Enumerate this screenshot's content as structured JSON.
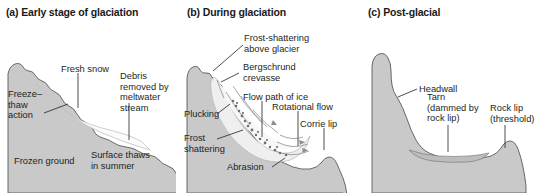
{
  "figure": {
    "background_color": "#ffffff",
    "rock_fill": "#c9c9c9",
    "rock_stroke": "#58595b",
    "ice_fill": "#efefef",
    "snow_fill": "#fbfbfb",
    "text_color": "#231f20",
    "leader_color": "#231f20"
  },
  "panels": [
    {
      "id": "a",
      "title": "(a) Early stage of glaciation",
      "labels": [
        {
          "name": "fresh-snow",
          "text": "Fresh snow"
        },
        {
          "name": "debris-removed",
          "text": "Debris\nremoved by\nmeltwater\nstream",
          "lines": [
            "Debris",
            "removed by",
            "meltwater",
            "stream"
          ]
        },
        {
          "name": "freeze-thaw-action",
          "text": "Freeze–\nthaw\naction",
          "lines": [
            "Freeze–",
            "thaw",
            "action"
          ]
        },
        {
          "name": "frozen-ground",
          "text": "Frozen ground"
        },
        {
          "name": "surface-thaws",
          "text": "Surface thaws\nin summer",
          "lines": [
            "Surface thaws",
            "in summer"
          ]
        }
      ]
    },
    {
      "id": "b",
      "title": "(b) During glaciation",
      "labels": [
        {
          "name": "frost-shattering-above-glacier",
          "text": "Frost-shattering\nabove glacier",
          "lines": [
            "Frost-shattering",
            "above glacier"
          ]
        },
        {
          "name": "bergschrund-crevasse",
          "text": "Bergschrund\ncrevasse",
          "lines": [
            "Bergschrund",
            "crevasse"
          ]
        },
        {
          "name": "flow-path-of-ice",
          "text": "Flow path of ice"
        },
        {
          "name": "rotational-flow",
          "text": "Rotational flow"
        },
        {
          "name": "corrie-lip",
          "text": "Corrie lip"
        },
        {
          "name": "plucking",
          "text": "Plucking"
        },
        {
          "name": "frost-shattering",
          "text": "Frost\nshattering",
          "lines": [
            "Frost",
            "shattering"
          ]
        },
        {
          "name": "abrasion",
          "text": "Abrasion"
        }
      ]
    },
    {
      "id": "c",
      "title": "(c) Post-glacial",
      "labels": [
        {
          "name": "headwall",
          "text": "Headwall"
        },
        {
          "name": "tarn",
          "text": "Tarn\n(dammed by\nrock lip)",
          "lines": [
            "Tarn",
            "(dammed by",
            "rock lip)"
          ]
        },
        {
          "name": "rock-lip-threshold",
          "text": "Rock lip\n(threshold)",
          "lines": [
            "Rock lip",
            "(threshold)"
          ]
        }
      ]
    }
  ]
}
